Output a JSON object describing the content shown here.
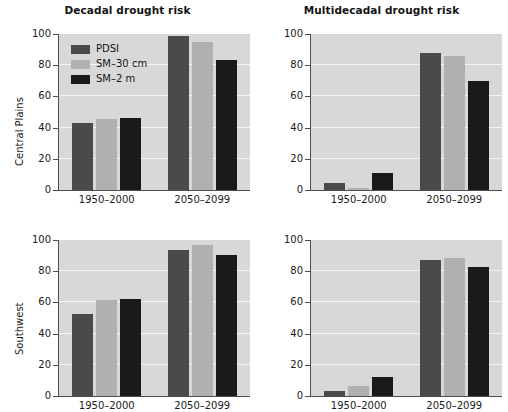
{
  "figure": {
    "xlabel": "Years",
    "row_labels": [
      "Central Plains",
      "Southwest"
    ],
    "panel_titles": [
      "Decadal drought risk",
      "Multidecadal drought risk"
    ],
    "ytick_labels": [
      "0",
      "20",
      "40",
      "60",
      "80",
      "100"
    ],
    "xtick_labels": [
      "1950–2000",
      "2050–2099"
    ],
    "legend": {
      "items": [
        {
          "label": "PDSI",
          "color": "#4a4a4a"
        },
        {
          "label": "SM–30 cm",
          "color": "#b0b0b0"
        },
        {
          "label": "SM–2 m",
          "color": "#1a1a1a"
        }
      ]
    },
    "colors": {
      "pdsi": "#4a4a4a",
      "sm30cm": "#b0b0b0",
      "sm2m": "#1a1a1a",
      "plot_background": "#d8d8d8",
      "gridline": "#f4f4f4",
      "axis": "#4d4d4d",
      "text": "#1a1a1a"
    }
  },
  "chart_data": [
    {
      "id": "central-plains-decadal",
      "type": "bar",
      "title": "Decadal drought risk",
      "row": "Central Plains",
      "xlabel": "Years",
      "ylabel": "Central Plains",
      "ylim": [
        0,
        100
      ],
      "yticks": [
        0,
        20,
        40,
        60,
        80,
        100
      ],
      "grid": true,
      "legend_position": "upper-left",
      "categories": [
        "1950–2000",
        "2050–2099"
      ],
      "series": [
        {
          "name": "PDSI",
          "color": "#4a4a4a",
          "values": [
            43,
            99
          ]
        },
        {
          "name": "SM–30 cm",
          "color": "#b0b0b0",
          "values": [
            45.5,
            95
          ]
        },
        {
          "name": "SM–2 m",
          "color": "#1a1a1a",
          "values": [
            46,
            83.5
          ]
        }
      ]
    },
    {
      "id": "central-plains-multidecadal",
      "type": "bar",
      "title": "Multidecadal drought risk",
      "row": "Central Plains",
      "xlabel": "Years",
      "ylabel": "",
      "ylim": [
        0,
        100
      ],
      "yticks": [
        0,
        20,
        40,
        60,
        80,
        100
      ],
      "grid": true,
      "legend_position": "none",
      "categories": [
        "1950–2000",
        "2050–2099"
      ],
      "series": [
        {
          "name": "PDSI",
          "color": "#4a4a4a",
          "values": [
            4.5,
            88
          ]
        },
        {
          "name": "SM–30 cm",
          "color": "#b0b0b0",
          "values": [
            1,
            86
          ]
        },
        {
          "name": "SM–2 m",
          "color": "#1a1a1a",
          "values": [
            11,
            70
          ]
        }
      ]
    },
    {
      "id": "southwest-decadal",
      "type": "bar",
      "title": "Decadal drought risk",
      "row": "Southwest",
      "xlabel": "Years",
      "ylabel": "Southwest",
      "ylim": [
        0,
        100
      ],
      "yticks": [
        0,
        20,
        40,
        60,
        80,
        100
      ],
      "grid": true,
      "legend_position": "none",
      "categories": [
        "1950–2000",
        "2050–2099"
      ],
      "series": [
        {
          "name": "PDSI",
          "color": "#4a4a4a",
          "values": [
            52.5,
            93.5
          ]
        },
        {
          "name": "SM–30 cm",
          "color": "#b0b0b0",
          "values": [
            61.5,
            97
          ]
        },
        {
          "name": "SM–2 m",
          "color": "#1a1a1a",
          "values": [
            62,
            90.5
          ]
        }
      ]
    },
    {
      "id": "southwest-multidecadal",
      "type": "bar",
      "title": "Multidecadal drought risk",
      "row": "Southwest",
      "xlabel": "Years",
      "ylabel": "",
      "ylim": [
        0,
        100
      ],
      "yticks": [
        0,
        20,
        40,
        60,
        80,
        100
      ],
      "grid": true,
      "legend_position": "none",
      "categories": [
        "1950–2000",
        "2050–2099"
      ],
      "series": [
        {
          "name": "PDSI",
          "color": "#4a4a4a",
          "values": [
            3.5,
            87.5
          ]
        },
        {
          "name": "SM–30 cm",
          "color": "#b0b0b0",
          "values": [
            6.5,
            88.5
          ]
        },
        {
          "name": "SM–2 m",
          "color": "#1a1a1a",
          "values": [
            12.5,
            83
          ]
        }
      ]
    }
  ]
}
